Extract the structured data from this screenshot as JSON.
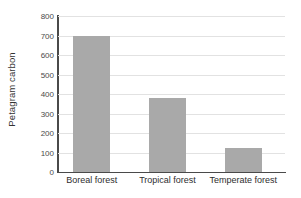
{
  "chart_data": {
    "type": "bar",
    "title": "",
    "xlabel": "",
    "ylabel": "Petagram carbon",
    "categories": [
      "Boreal forest",
      "Tropical forest",
      "Temperate forest"
    ],
    "values": [
      700,
      380,
      125
    ],
    "ylim": [
      0,
      800
    ],
    "ytick_labels": [
      "800",
      "700",
      "600",
      "500",
      "400",
      "300",
      "200",
      "100",
      "0"
    ],
    "ytick_values": [
      800,
      700,
      600,
      500,
      400,
      300,
      200,
      100,
      0
    ],
    "grid": "horizontal",
    "legend": "none",
    "bar_color": "#a9a9a9",
    "grid_color": "#e2e2e2",
    "axis_color": "#4a4a4a"
  }
}
